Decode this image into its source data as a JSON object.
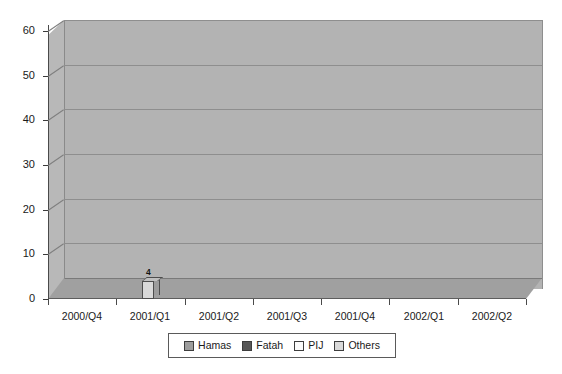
{
  "chart_data": {
    "type": "bar",
    "title": "",
    "xlabel": "",
    "ylabel": "",
    "ylim": [
      0,
      60
    ],
    "ytick_labels": [
      "0",
      "10",
      "20",
      "30",
      "40",
      "50",
      "60"
    ],
    "ytick_values": [
      0,
      10,
      20,
      30,
      40,
      50,
      60
    ],
    "grid": true,
    "legend_position": "bottom",
    "categories": [
      "2000/Q4",
      "2001/Q1",
      "2001/Q2",
      "2001/Q3",
      "2001/Q4",
      "2002/Q1",
      "2002/Q2"
    ],
    "series": [
      {
        "name": "Hamas",
        "color": "#9d9d9d",
        "values": [
          0,
          0,
          27,
          3,
          29,
          55,
          43
        ]
      },
      {
        "name": "Fatah",
        "color": "#575757",
        "values": [
          0,
          0,
          0,
          2,
          0,
          24,
          18
        ]
      },
      {
        "name": "PIJ",
        "color": "#fbfbfb",
        "values": [
          0,
          0,
          0,
          15,
          1,
          9,
          17
        ]
      },
      {
        "name": "Others",
        "color": "#d9d9d9",
        "values": [
          0,
          4,
          0,
          0,
          3,
          2,
          4
        ]
      }
    ],
    "bar_labels": {
      "2001/Q1": {
        "Others": "4"
      },
      "2001/Q2": {
        "Hamas": "27"
      },
      "2001/Q3": {
        "Hamas": "3",
        "Fatah": "2",
        "PIJ": "15"
      },
      "2001/Q4": {
        "Hamas": "29",
        "PIJ": "1",
        "Others": "3"
      },
      "2002/Q1": {
        "Hamas": "55",
        "Fatah": "24",
        "PIJ": "9",
        "Others": "2"
      },
      "2002/Q2": {
        "Hamas": "43",
        "Fatah": "18",
        "PIJ": "17",
        "Others": "4"
      }
    }
  },
  "legend": {
    "items": [
      {
        "label": "Hamas",
        "color": "#9d9d9d"
      },
      {
        "label": "Fatah",
        "color": "#575757"
      },
      {
        "label": "PIJ",
        "color": "#fbfbfb"
      },
      {
        "label": "Others",
        "color": "#d9d9d9"
      }
    ]
  },
  "colors": {
    "plot_background": "#b3b3b3",
    "floor": "#a0a0a0",
    "gridline": "#8e8e8e",
    "axis": "#3a3a3a",
    "page_background": "#ffffff"
  }
}
